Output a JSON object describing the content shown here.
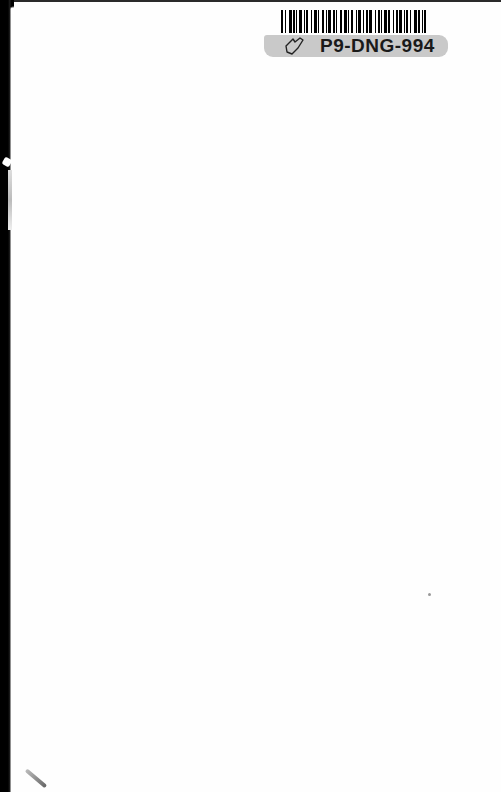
{
  "page": {
    "type": "blank inside cover page",
    "background_color": "#fefefe"
  },
  "sticker": {
    "barcode": {
      "icon": "barcode-icon"
    },
    "label_text": "P9-DNG-994",
    "label_icon": "tag-outline-icon",
    "band_color": "#c9c9c9"
  }
}
